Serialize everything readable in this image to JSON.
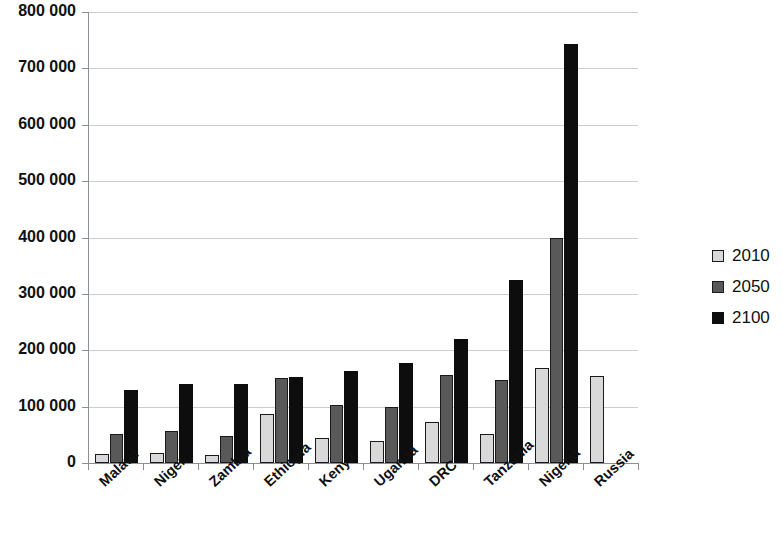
{
  "chart_data": {
    "type": "bar",
    "title": "",
    "subtitle": "",
    "xlabel": "",
    "ylabel": "",
    "ylim": [
      0,
      800000
    ],
    "ytick_labels": [
      "0",
      "100 000",
      "200 000",
      "300 000",
      "400 000",
      "500 000",
      "600 000",
      "700 000",
      "800 000"
    ],
    "ytick_values": [
      0,
      100000,
      200000,
      300000,
      400000,
      500000,
      600000,
      700000,
      800000
    ],
    "grid": true,
    "legend_position": "right",
    "categories": [
      "Malawi",
      "Niger",
      "Zambia",
      "Ethiopia",
      "Kenya",
      "Uganda",
      "DRC",
      "Tanzania",
      "Nigeria",
      "Russia"
    ],
    "series": [
      {
        "name": "2010",
        "color": "#d9d9d9",
        "values": [
          16000,
          17000,
          15000,
          87000,
          45000,
          39000,
          73000,
          52000,
          168000,
          155000
        ]
      },
      {
        "name": "2050",
        "color": "#595959",
        "values": [
          51000,
          57000,
          48000,
          150000,
          103000,
          100000,
          157000,
          147000,
          400000,
          null
        ]
      },
      {
        "name": "2100",
        "color": "#0d0d0d",
        "values": [
          130000,
          140000,
          141000,
          153000,
          163000,
          177000,
          220000,
          325000,
          743000,
          null
        ]
      }
    ]
  },
  "legend": {
    "items": [
      {
        "label": "2010",
        "swatch": "legend-swatch-2010"
      },
      {
        "label": "2050",
        "swatch": "legend-swatch-2050"
      },
      {
        "label": "2100",
        "swatch": "legend-swatch-2100"
      }
    ]
  }
}
